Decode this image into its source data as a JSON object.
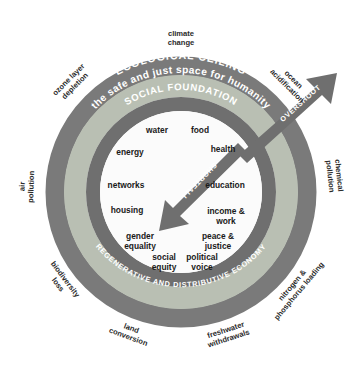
{
  "diagram": {
    "colors": {
      "background": "#ffffff",
      "ecological_ring": "#7a7a7a",
      "safe_space_ring": "#b9bfb3",
      "social_ring": "#6f6f6f",
      "center": "#fbfbfb",
      "arrow": "#6f6f6f",
      "label_text": "#2b2b2b",
      "ring_text": "#ffffff"
    },
    "ring_labels": {
      "ecological_ceiling": "ECOLOGICAL CEILING",
      "safe_space": "the safe and just space for humanity",
      "social_foundation": "SOCIAL FOUNDATION",
      "regenerative": "REGENERATIVE AND DISTRIBUTIVE ECONOMY"
    },
    "arrows": {
      "overshoot": "OVERSHOOT",
      "shortfall": "SHORTFALL"
    },
    "social_foundation_items": [
      {
        "id": "water",
        "label": "water",
        "x": 157,
        "y": 133
      },
      {
        "id": "food",
        "label": "food",
        "x": 200,
        "y": 133
      },
      {
        "id": "energy",
        "label": "energy",
        "x": 130,
        "y": 155
      },
      {
        "id": "health",
        "label": "health",
        "x": 223,
        "y": 152
      },
      {
        "id": "networks",
        "label": "networks",
        "x": 126,
        "y": 188
      },
      {
        "id": "education",
        "label": "education",
        "x": 225,
        "y": 188
      },
      {
        "id": "housing",
        "label": "housing",
        "x": 127,
        "y": 213
      },
      {
        "id": "income-and-work",
        "label": "income & work",
        "x": 226,
        "y": 214
      },
      {
        "id": "gender-equality",
        "label": "gender equality",
        "x": 140,
        "y": 239
      },
      {
        "id": "peace-and-justice",
        "label": "peace & justice",
        "x": 218,
        "y": 239
      },
      {
        "id": "social-equity",
        "label": "social equity",
        "x": 164,
        "y": 260
      },
      {
        "id": "political-voice",
        "label": "political voice",
        "x": 202,
        "y": 260
      }
    ],
    "ecological_ceiling_items": [
      {
        "id": "climate-change",
        "label": "climate change",
        "angle_deg": -90
      },
      {
        "id": "ocean-acidification",
        "label": "ocean acidification",
        "angle_deg": -45
      },
      {
        "id": "chemical-pollution",
        "label": "chemical pollution",
        "angle_deg": -6
      },
      {
        "id": "nitrogen-and-phosphorus-loading",
        "label": "nitrogen & phosphorus loading",
        "angle_deg": 40
      },
      {
        "id": "freshwater-withdrawals",
        "label": "freshwater withdrawals",
        "angle_deg": 72
      },
      {
        "id": "land-conversion",
        "label": "land conversion",
        "angle_deg": 110
      },
      {
        "id": "biodiversity-loss",
        "label": "biodiversity loss",
        "angle_deg": 143
      },
      {
        "id": "air-pollution",
        "label": "air pollution",
        "angle_deg": 182
      },
      {
        "id": "ozone-layer-depletion",
        "label": "ozone layer depletion",
        "angle_deg": -135
      }
    ]
  }
}
